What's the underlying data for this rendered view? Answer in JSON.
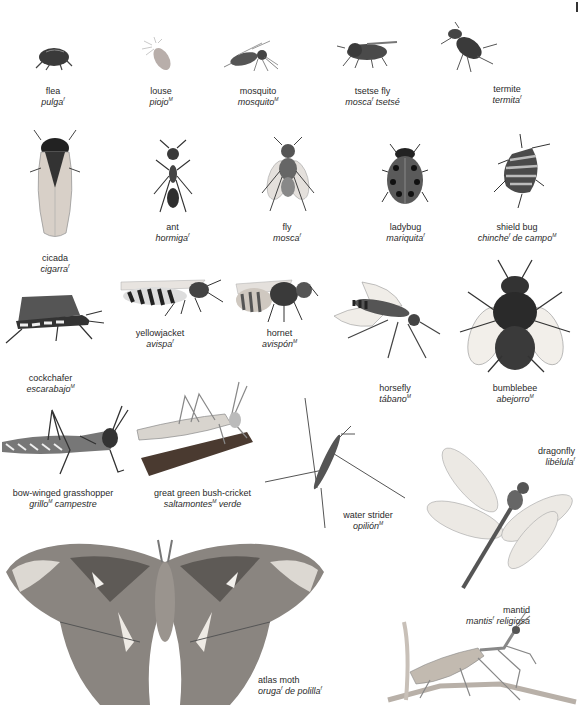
{
  "page": {
    "type": "visual dictionary",
    "language_pair": [
      "English",
      "Spanish"
    ]
  },
  "insects": [
    {
      "id": "flea",
      "en": "flea",
      "es": "pulga",
      "es_gender": "f"
    },
    {
      "id": "louse",
      "en": "louse",
      "es": "piojo",
      "es_gender": "M"
    },
    {
      "id": "mosquito",
      "en": "mosquito",
      "es": "mosquito",
      "es_gender": "M"
    },
    {
      "id": "tsetse-fly",
      "en": "tsetse fly",
      "es": "mosca",
      "es_gender": "f",
      "es_suffix": " tsetsé"
    },
    {
      "id": "termite",
      "en": "termite",
      "es": "termita",
      "es_gender": "f"
    },
    {
      "id": "cicada",
      "en": "cicada",
      "es": "cigarra",
      "es_gender": "f"
    },
    {
      "id": "ant",
      "en": "ant",
      "es": "hormiga",
      "es_gender": "f"
    },
    {
      "id": "fly",
      "en": "fly",
      "es": "mosca",
      "es_gender": "f"
    },
    {
      "id": "ladybug",
      "en": "ladybug",
      "es": "mariquita",
      "es_gender": "f"
    },
    {
      "id": "shield-bug",
      "en": "shield bug",
      "es": "chinche",
      "es_gender": "f",
      "es_suffix": " de campo",
      "es_suffix_gender": "M"
    },
    {
      "id": "cockchafer",
      "en": "cockchafer",
      "es": "escarabajo",
      "es_gender": "M"
    },
    {
      "id": "yellowjacket",
      "en": "yellowjacket",
      "es": "avispa",
      "es_gender": "f"
    },
    {
      "id": "hornet",
      "en": "hornet",
      "es": "avispón",
      "es_gender": "M"
    },
    {
      "id": "horsefly",
      "en": "horsefly",
      "es": "tábano",
      "es_gender": "M"
    },
    {
      "id": "bumblebee",
      "en": "bumblebee",
      "es": "abejorro",
      "es_gender": "M"
    },
    {
      "id": "bow-winged-grasshopper",
      "en": "bow-winged grasshopper",
      "es": "grillo",
      "es_gender": "M",
      "es_suffix": " campestre"
    },
    {
      "id": "great-green-bush-cricket",
      "en": "great green bush-cricket",
      "es": "saltamontes",
      "es_gender": "M",
      "es_suffix": " verde"
    },
    {
      "id": "water-strider",
      "en": "water strider",
      "es": "opilión",
      "es_gender": "M"
    },
    {
      "id": "dragonfly",
      "en": "dragonfly",
      "es": "libélula",
      "es_gender": "f"
    },
    {
      "id": "atlas-moth",
      "en": "atlas moth",
      "es": "oruga",
      "es_gender": "f",
      "es_suffix": " de polilla",
      "es_suffix_gender": "f"
    },
    {
      "id": "mantid",
      "en": "mantid",
      "es": "mantis",
      "es_gender": "f",
      "es_suffix": " religiosa"
    }
  ]
}
